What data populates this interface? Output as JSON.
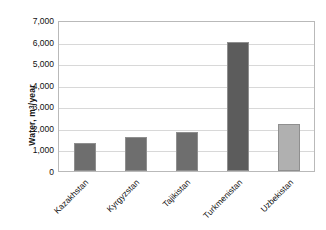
{
  "chart_data": {
    "type": "bar",
    "title": "",
    "subtitle": "",
    "xlabel": "",
    "ylabel": "Water, m³/year",
    "ylabel_base": "Water, m",
    "ylabel_exponent": "3",
    "ylabel_suffix": "/year",
    "categories": [
      "Kazakhstan",
      "Kyrgyzstan",
      "Tajikistan",
      "Turkmenistan",
      "Uzbekistan"
    ],
    "values": [
      1300,
      1600,
      1800,
      6000,
      2200
    ],
    "ylim": [
      0,
      7000
    ],
    "ytick_values": [
      0,
      1000,
      2000,
      3000,
      4000,
      5000,
      6000,
      7000
    ],
    "ytick_labels": [
      "0",
      "1,000",
      "2,000",
      "3,000",
      "4,000",
      "5,000",
      "6,000",
      "7,000"
    ],
    "grid": true,
    "legend": false,
    "legend_position": "none",
    "bar_colors": [
      "#6e6e6e",
      "#6e6e6e",
      "#6e6e6e",
      "#5c5c5c",
      "#b0b0b0"
    ],
    "plot_border_color": "#b9b9b9",
    "gridline_color": "#d8d8d8",
    "background_color": "#ffffff"
  }
}
